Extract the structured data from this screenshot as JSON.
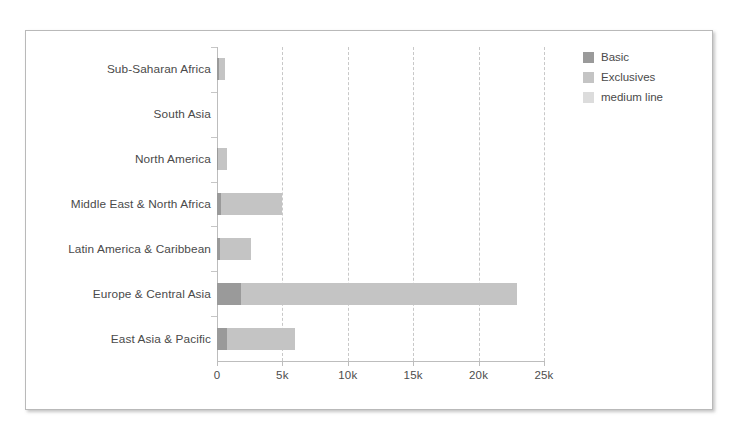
{
  "chart_data": {
    "type": "bar",
    "orientation": "horizontal",
    "stacked": true,
    "title": "",
    "xlabel": "",
    "ylabel": "",
    "categories": [
      "East Asia & Pacific",
      "Europe & Central Asia",
      "Latin America & Caribbean",
      "Middle East & North Africa",
      "North America",
      "South Asia",
      "Sub-Saharan Africa"
    ],
    "series": [
      {
        "name": "Basic",
        "color": "#9a9a9a",
        "values": [
          750,
          1800,
          230,
          300,
          60,
          0,
          120
        ]
      },
      {
        "name": "Exclusives",
        "color": "#c4c4c4",
        "values": [
          5250,
          21100,
          2370,
          4700,
          690,
          0,
          480
        ]
      },
      {
        "name": "medium line",
        "color": "#dcdcdc",
        "values": [
          0,
          0,
          0,
          0,
          0,
          0,
          0
        ]
      }
    ],
    "totals": [
      6000,
      22900,
      2600,
      5000,
      750,
      0,
      600
    ],
    "xlim": [
      0,
      25000
    ],
    "xticks": [
      0,
      5000,
      10000,
      15000,
      20000,
      25000
    ],
    "xtick_labels": [
      "0",
      "5k",
      "10k",
      "15k",
      "20k",
      "25k"
    ],
    "grid": "vertical-dashed",
    "legend_position": "top-right"
  },
  "legend": {
    "items": [
      {
        "label": "Basic",
        "color": "#9a9a9a"
      },
      {
        "label": "Exclusives",
        "color": "#c4c4c4"
      },
      {
        "label": "medium line",
        "color": "#dcdcdc"
      }
    ]
  },
  "style": {
    "background": "#ffffff",
    "frame_border": "#b9b9b9",
    "axis_color": "#bdbdbd",
    "grid_color": "#c8c8c8",
    "text_color": "#4a4a4a"
  }
}
